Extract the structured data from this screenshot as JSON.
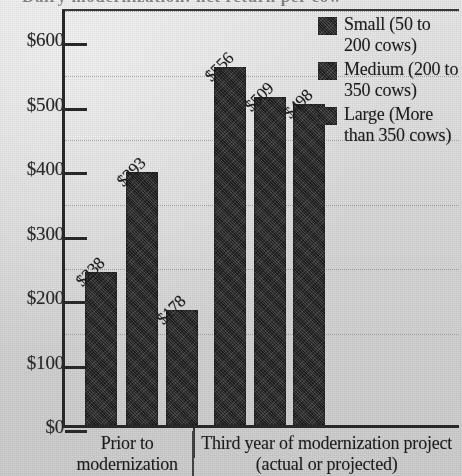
{
  "title": {
    "text": "Dairy modernization: net return per cow",
    "cropped": true
  },
  "chart_data": {
    "type": "bar",
    "title": "Dairy modernization: net return per cow",
    "xlabel": "",
    "ylabel": "",
    "ylim": [
      0,
      650
    ],
    "ytick_values": [
      0,
      100,
      200,
      300,
      400,
      500,
      600
    ],
    "ytick_labels": [
      "$0",
      "$100",
      "$200",
      "$300",
      "$400",
      "$500",
      "$600"
    ],
    "grid": "horizontal-dotted",
    "legend_position": "top-right",
    "categories": [
      "Prior to modernization",
      "Third year of modernization project (actual or projected)"
    ],
    "series": [
      {
        "name": "Small (50 to 200 cows)",
        "values": [
          238,
          509
        ],
        "labels": [
          "$238",
          "$556"
        ]
      },
      {
        "name": "Medium (200 to 350 cows)",
        "values": [
          393,
          509
        ],
        "labels": [
          "$393",
          "$509"
        ]
      },
      {
        "name": "Large (More than 350 cows)",
        "values": [
          178,
          498
        ],
        "labels": [
          "$178",
          "$498"
        ]
      }
    ],
    "bars": [
      {
        "group": 0,
        "series": "Small (50 to 200 cows)",
        "value": 238,
        "label": "$238"
      },
      {
        "group": 0,
        "series": "Medium (200 to 350 cows)",
        "value": 393,
        "label": "$393"
      },
      {
        "group": 0,
        "series": "Large (More than 350 cows)",
        "value": 178,
        "label": "$178"
      },
      {
        "group": 1,
        "series": "Small (50 to 200 cows)",
        "value": 556,
        "label": "$556"
      },
      {
        "group": 1,
        "series": "Medium (200 to 350 cows)",
        "value": 509,
        "label": "$509"
      },
      {
        "group": 1,
        "series": "Large (More than 350 cows)",
        "value": 498,
        "label": "$498"
      }
    ],
    "colors": {
      "bar": "#2e2e2e",
      "axis": "#2a2a2a",
      "background": "#dcdcdc"
    }
  },
  "legend": {
    "items": [
      {
        "label": "Small (50 to 200 cows)"
      },
      {
        "label": "Medium (200 to 350 cows)"
      },
      {
        "label": "Large (More than 350 cows)"
      }
    ]
  },
  "xaxis": {
    "categories": [
      {
        "label": "Prior to modernization"
      },
      {
        "label": "Third year of modernization project (actual or projected)"
      }
    ]
  }
}
